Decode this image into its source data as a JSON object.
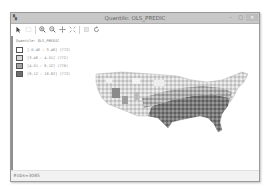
{
  "window": {
    "title": "Quantile: OLS_PREDIC",
    "app_icon": "geoda-icon",
    "controls": [
      "minimize",
      "maximize",
      "close"
    ]
  },
  "toolbar": {
    "buttons": [
      {
        "name": "select-tool",
        "icon": "arrow-pointer-icon",
        "enabled": true
      },
      {
        "name": "select-rect-tool",
        "icon": "select-rect-icon",
        "enabled": false
      },
      {
        "name": "zoom-in",
        "icon": "zoom-in-icon",
        "enabled": true
      },
      {
        "name": "zoom-out",
        "icon": "zoom-out-icon",
        "enabled": true
      },
      {
        "name": "pan",
        "icon": "pan-icon",
        "enabled": true
      },
      {
        "name": "fit-extent",
        "icon": "fit-extent-icon",
        "enabled": true
      },
      {
        "name": "disabled-tool",
        "icon": "layer-icon",
        "enabled": false
      },
      {
        "name": "refresh",
        "icon": "refresh-icon",
        "enabled": true
      }
    ]
  },
  "legend": {
    "title": "Quantile: OLS_PREDIC",
    "items": [
      {
        "label": "[-0.46 : 3.46] (772)",
        "color": "#ffffff"
      },
      {
        "label": "[3.46 : 4.51] (772)",
        "color": "#d9d9d9"
      },
      {
        "label": "[4.51 : 6.12] (770)",
        "color": "#a6a6a6"
      },
      {
        "label": "[6.12 : 18.82] (772)",
        "color": "#6e6e6e"
      }
    ]
  },
  "map": {
    "description": "US counties choropleth",
    "colors": [
      "#ffffff",
      "#d9d9d9",
      "#a6a6a6",
      "#6e6e6e"
    ]
  },
  "status": {
    "text": "#obs=3085"
  }
}
